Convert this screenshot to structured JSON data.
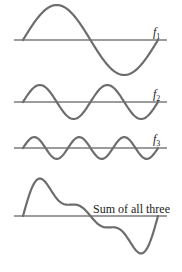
{
  "figure": {
    "panels": [
      {
        "id": "f1",
        "label": "f",
        "subscript": "1",
        "harmonic": 1,
        "relative_amplitude": 1.0
      },
      {
        "id": "f2",
        "label": "f",
        "subscript": "2",
        "harmonic": 2,
        "relative_amplitude": 0.5
      },
      {
        "id": "f3",
        "label": "f",
        "subscript": "3",
        "harmonic": 3,
        "relative_amplitude": 0.33
      },
      {
        "id": "sum",
        "label": "Sum of all three"
      }
    ]
  },
  "chart_data": {
    "type": "line",
    "title": "",
    "xlabel": "",
    "ylabel": "",
    "grid": false,
    "legend": "inline labels at right end of each axis",
    "x": "0 to 1 period of fundamental",
    "series": [
      {
        "name": "f1",
        "formula": "sin(2πt)",
        "amplitude": 1.0,
        "cycles": 1
      },
      {
        "name": "f2",
        "formula": "0.5·sin(4πt)",
        "amplitude": 0.5,
        "cycles": 2
      },
      {
        "name": "f3",
        "formula": "0.33·sin(6πt)",
        "amplitude": 0.33,
        "cycles": 3
      },
      {
        "name": "Sum of all three",
        "formula": "f1 + f2 + f3"
      }
    ]
  },
  "colors": {
    "wave": "#6d6d6d",
    "axis": "#3a3a3a",
    "text": "#222222",
    "background": "#ffffff"
  }
}
